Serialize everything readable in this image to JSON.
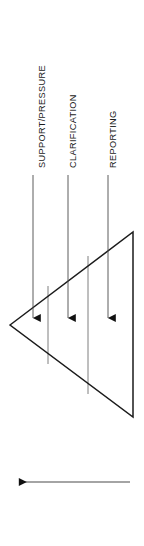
{
  "diagram": {
    "type": "funnel-triangle-process-diagram",
    "orientation": "left-pointing triangle with downward stage arrows",
    "stroke_color": "#1b1b1b",
    "thin_stroke_color": "#6f6f6f",
    "background_color": "#ffffff",
    "stage_labels": [
      {
        "id": "support-pressure",
        "text": "SUPPORT/PRESSURE"
      },
      {
        "id": "clarification",
        "text": "CLARIFICATION"
      },
      {
        "id": "reporting",
        "text": "REPORTING"
      }
    ],
    "stage_arrows": [
      {
        "id": "arrow-support-pressure",
        "x": 33,
        "y_start": 175,
        "y_tip": 327
      },
      {
        "id": "arrow-clarification",
        "x": 68,
        "y_start": 175,
        "y_tip": 327
      },
      {
        "id": "arrow-reporting",
        "x": 108,
        "y_start": 175,
        "y_tip": 327
      }
    ],
    "triangle": {
      "apex": {
        "x": 10,
        "y": 325
      },
      "top_right": {
        "x": 133,
        "y": 232
      },
      "bottom_right": {
        "x": 133,
        "y": 417
      }
    },
    "dividers": [
      {
        "id": "divider-1",
        "x": 48
      },
      {
        "id": "divider-2",
        "x": 88
      }
    ],
    "bottom_arrow": {
      "id": "direction-arrow",
      "direction": "left",
      "x_tip": 11,
      "x_tail": 130,
      "y": 482
    }
  }
}
